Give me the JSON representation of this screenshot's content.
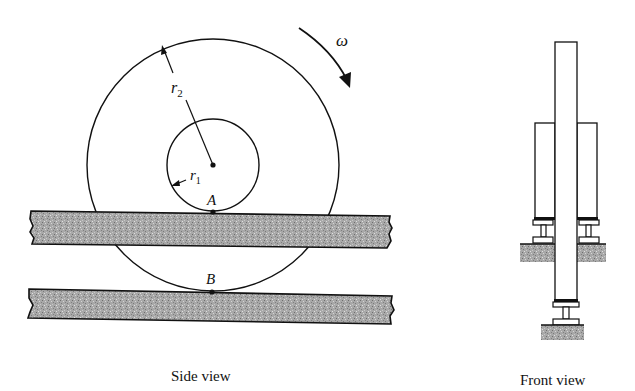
{
  "figure": {
    "side_view": {
      "caption": "Side view",
      "labels": {
        "outer_radius": "r",
        "outer_radius_sub": "2",
        "inner_radius": "r",
        "inner_radius_sub": "1",
        "point_a": "A",
        "point_b": "B",
        "angular_velocity": "ω"
      }
    },
    "front_view": {
      "caption": "Front view"
    },
    "colors": {
      "line": "#111111",
      "rail_fill": "#9a9a9a"
    }
  }
}
